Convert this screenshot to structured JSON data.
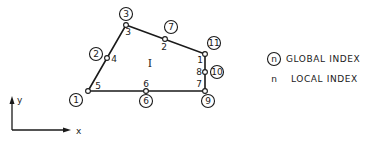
{
  "diagram": {
    "element_label": "I",
    "nodes": [
      {
        "global": "1",
        "local": "5",
        "x": 88,
        "y": 91
      },
      {
        "global": "2",
        "local": "4",
        "x": 107,
        "y": 58
      },
      {
        "global": "3",
        "local": "3",
        "x": 126,
        "y": 25
      },
      {
        "global": "7",
        "local": "2",
        "x": 165,
        "y": 39
      },
      {
        "global": "11",
        "local": "1",
        "x": 205,
        "y": 54
      },
      {
        "global": "10",
        "local": "8",
        "x": 205,
        "y": 72
      },
      {
        "global": "9",
        "local": "7",
        "x": 205,
        "y": 91
      },
      {
        "global": "6",
        "local": "6",
        "x": 146,
        "y": 91
      }
    ],
    "axes": {
      "x_label": "x",
      "y_label": "y"
    },
    "legend": {
      "global_symbol": "n",
      "global_label": "GLOBAL INDEX",
      "local_symbol": "n",
      "local_label": "LOCAL INDEX"
    }
  }
}
